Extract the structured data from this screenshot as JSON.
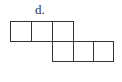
{
  "diagram": {
    "label": "d.",
    "type": "cube-net",
    "squares": [
      {
        "row": 0,
        "col": 0
      },
      {
        "row": 0,
        "col": 1
      },
      {
        "row": 0,
        "col": 2
      },
      {
        "row": 1,
        "col": 2
      },
      {
        "row": 1,
        "col": 3
      },
      {
        "row": 1,
        "col": 4
      }
    ],
    "stroke_color": "#333333"
  }
}
